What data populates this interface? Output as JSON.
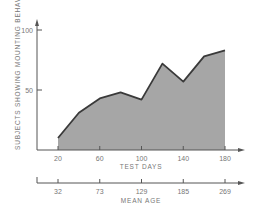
{
  "chart_data": {
    "type": "area",
    "title": "",
    "xlabel": "TEST DAYS",
    "ylabel": "SUBJECTS SHOWING MOUNTING BEHAVIOR, PERCENT",
    "secondary_xlabel": "MEAN AGE",
    "x": [
      20,
      40,
      60,
      80,
      100,
      120,
      140,
      160,
      180
    ],
    "values": [
      10,
      31,
      43,
      48,
      42,
      72,
      57,
      78,
      83
    ],
    "xticks": [
      "20",
      "60",
      "100",
      "140",
      "180"
    ],
    "yticks": [
      "50",
      "100"
    ],
    "secondary_xticks": [
      "32",
      "73",
      "129",
      "185",
      "269"
    ],
    "xlim": [
      0,
      200
    ],
    "ylim": [
      0,
      100
    ],
    "grid": false,
    "legend": null,
    "colors": {
      "fill": "#a6a6a6",
      "line": "#3a3a3a",
      "axis": "#555555",
      "text": "#777777"
    }
  },
  "axes": {
    "y_label": "SUBJECTS SHOWING MOUNTING BEHAVIOR, PERCENT",
    "x_label": "TEST DAYS",
    "age_label": "MEAN AGE",
    "y_ticks": [
      {
        "label": "100",
        "value": 100
      },
      {
        "label": "50",
        "value": 50
      }
    ],
    "x_ticks": [
      {
        "label": "20",
        "value": 20
      },
      {
        "label": "60",
        "value": 60
      },
      {
        "label": "100",
        "value": 100
      },
      {
        "label": "140",
        "value": 140
      },
      {
        "label": "180",
        "value": 180
      }
    ],
    "age_ticks": [
      {
        "label": "32",
        "value": 20
      },
      {
        "label": "73",
        "value": 60
      },
      {
        "label": "129",
        "value": 100
      },
      {
        "label": "185",
        "value": 140
      },
      {
        "label": "269",
        "value": 180
      }
    ]
  }
}
